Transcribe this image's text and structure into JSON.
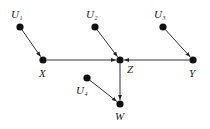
{
  "diagram": {
    "type": "causal-graph",
    "nodes": [
      {
        "id": "U1",
        "label": "U",
        "sub": "1",
        "x": 20,
        "y": 27,
        "lx": 11,
        "ly": 18
      },
      {
        "id": "U2",
        "label": "U",
        "sub": "2",
        "x": 95,
        "y": 27,
        "lx": 86,
        "ly": 18
      },
      {
        "id": "U3",
        "label": "U",
        "sub": "3",
        "x": 163,
        "y": 27,
        "lx": 154,
        "ly": 18
      },
      {
        "id": "X",
        "label": "X",
        "sub": "",
        "x": 43,
        "y": 60,
        "lx": 39,
        "ly": 77
      },
      {
        "id": "Z",
        "label": "Z",
        "sub": "",
        "x": 120,
        "y": 60,
        "lx": 127,
        "ly": 73
      },
      {
        "id": "Y",
        "label": "Y",
        "sub": "",
        "x": 193,
        "y": 60,
        "lx": 189,
        "ly": 77
      },
      {
        "id": "U4",
        "label": "U",
        "sub": "4",
        "x": 87,
        "y": 78,
        "lx": 76,
        "ly": 94
      },
      {
        "id": "W",
        "label": "W",
        "sub": "",
        "x": 120,
        "y": 104,
        "lx": 115,
        "ly": 120
      }
    ],
    "edges": [
      {
        "from": "U1",
        "to": "X"
      },
      {
        "from": "U2",
        "to": "Z"
      },
      {
        "from": "U3",
        "to": "Y"
      },
      {
        "from": "X",
        "to": "Z"
      },
      {
        "from": "Y",
        "to": "Z"
      },
      {
        "from": "Z",
        "to": "W"
      },
      {
        "from": "U4",
        "to": "W"
      }
    ],
    "colors": {
      "node": "#111111",
      "edge": "#333333",
      "label": "#222222"
    }
  }
}
